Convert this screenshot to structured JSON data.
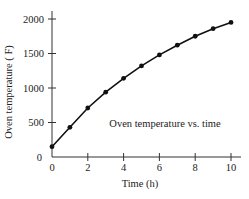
{
  "chart_data": {
    "type": "line",
    "title": "",
    "annotation": "Oven temperature vs. time",
    "xlabel": "Time (h)",
    "ylabel": "Oven temperature ( F)",
    "xlim": [
      0,
      10
    ],
    "ylim": [
      0,
      2000
    ],
    "x_ticks": [
      0,
      2,
      4,
      6,
      8,
      10
    ],
    "y_ticks": [
      0,
      500,
      1000,
      1500,
      2000
    ],
    "grid": false,
    "legend": null,
    "markers": true,
    "series": [
      {
        "name": "Oven temperature",
        "x": [
          0,
          1,
          2,
          3,
          4,
          5,
          6,
          7,
          8,
          9,
          10
        ],
        "values": [
          150,
          430,
          710,
          940,
          1140,
          1320,
          1480,
          1620,
          1750,
          1860,
          1950
        ]
      }
    ]
  },
  "colors": {
    "line": "#111111",
    "axis": "#333333",
    "background": "#ffffff"
  }
}
